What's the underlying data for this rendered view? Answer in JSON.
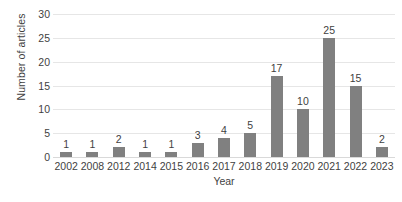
{
  "chart_data": {
    "type": "bar",
    "title": "",
    "subtitle": "",
    "xlabel": "Year",
    "ylabel": "Number of articles",
    "categories": [
      "2002",
      "2008",
      "2012",
      "2014",
      "2015",
      "2016",
      "2017",
      "2018",
      "2019",
      "2020",
      "2021",
      "2022",
      "2023"
    ],
    "values": [
      1,
      1,
      2,
      1,
      1,
      3,
      4,
      5,
      17,
      10,
      25,
      15,
      2
    ],
    "data_labels": [
      "1",
      "1",
      "2",
      "1",
      "1",
      "3",
      "4",
      "5",
      "17",
      "10",
      "25",
      "15",
      "2"
    ],
    "ylim": [
      0,
      30
    ],
    "ytick_values": [
      0,
      5,
      10,
      15,
      20,
      25,
      30
    ],
    "ytick_labels": [
      "0",
      "5",
      "10",
      "15",
      "20",
      "25",
      "30"
    ],
    "grid": true,
    "grid_axis": "y",
    "legend": false,
    "legend_position": "none",
    "bar_color": "#808080",
    "gridline_color": "#e6e6e6",
    "text_color": "#3f3f3f",
    "background_color": "#ffffff",
    "show_data_labels": true
  }
}
